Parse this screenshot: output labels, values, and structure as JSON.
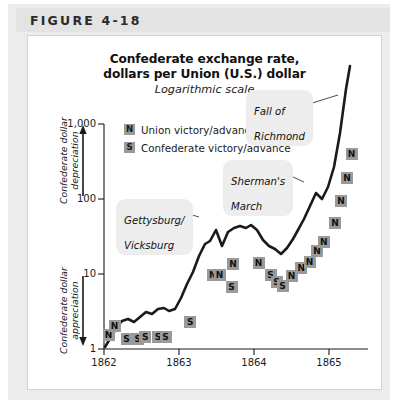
{
  "figure": {
    "header_label": "FIGURE 4-18",
    "title_line1": "Confederate exchange rate,",
    "title_line2": "dollars per Union (U.S.) dollar",
    "subtitle": "Logarithmic scale"
  },
  "legend": {
    "items": [
      {
        "marker": "N",
        "label": "Union victory/advance"
      },
      {
        "marker": "S",
        "label": "Confederate victory/advance"
      }
    ]
  },
  "side_labels": {
    "upper": "Confederate dollar\ndepreciation",
    "upper_line1": "Confederate dollar",
    "upper_line2": "depreciation",
    "lower_line1": "Confederate dollar",
    "lower_line2": "appreciation",
    "upper_arrow": "up-arrow",
    "lower_arrow": "down-arrow"
  },
  "annotations": [
    {
      "id": "gettysburg-vicksburg",
      "line1": "Gettysburg/",
      "line2": "Vicksburg"
    },
    {
      "id": "shermans-march",
      "line1": "Sherman's",
      "line2": "March"
    },
    {
      "id": "fall-of-richmond",
      "line1": "Fall of",
      "line2": "Richmond"
    }
  ],
  "chart_data": {
    "type": "line",
    "title": "Confederate exchange rate, dollars per Union (U.S.) dollar",
    "subtitle": "Logarithmic scale",
    "xlabel": "",
    "ylabel": "Confederate dollars per Union (U.S.) dollar",
    "yscale": "log",
    "ylim": [
      1,
      1000
    ],
    "ytick_labels": [
      "1",
      "10",
      "100",
      "1,000"
    ],
    "ytick_values": [
      1,
      10,
      100,
      1000
    ],
    "xlim": [
      1862.0,
      1865.5
    ],
    "xtick_labels": [
      "1862",
      "1863",
      "1864",
      "1865"
    ],
    "xtick_values": [
      1862,
      1863,
      1864,
      1865
    ],
    "grid": false,
    "legend_position": "top-left-inside",
    "series": [
      {
        "name": "Confederate exchange rate",
        "x": [
          1862.0,
          1862.08,
          1862.17,
          1862.25,
          1862.33,
          1862.42,
          1862.5,
          1862.58,
          1862.67,
          1862.75,
          1862.83,
          1862.92,
          1863.0,
          1863.08,
          1863.17,
          1863.25,
          1863.33,
          1863.42,
          1863.5,
          1863.58,
          1863.67,
          1863.75,
          1863.83,
          1863.92,
          1864.0,
          1864.08,
          1864.17,
          1864.25,
          1864.33,
          1864.42,
          1864.5,
          1864.58,
          1864.67,
          1864.75,
          1864.83,
          1864.92,
          1865.0,
          1865.08,
          1865.17,
          1865.25,
          1865.33,
          1865.42
        ],
        "y": [
          1.05,
          1.25,
          1.55,
          1.75,
          1.8,
          1.72,
          1.85,
          2.0,
          1.95,
          2.1,
          2.15,
          2.05,
          2.1,
          2.6,
          3.3,
          4.3,
          6.0,
          8.6,
          9.6,
          11.5,
          8.0,
          11.0,
          12.0,
          12.5,
          12.0,
          12.8,
          11.8,
          9.8,
          8.6,
          8.2,
          7.5,
          8.5,
          10.0,
          11.5,
          14.0,
          18.0,
          25.0,
          22.0,
          28.0,
          45.0,
          120.0,
          800.0
        ]
      }
    ],
    "event_markers": [
      {
        "label": "N",
        "x": 1862.06,
        "y": 1.55
      },
      {
        "label": "N",
        "x": 1862.14,
        "y": 2.05
      },
      {
        "label": "S",
        "x": 1862.3,
        "y": 1.35
      },
      {
        "label": "S",
        "x": 1862.45,
        "y": 1.35
      },
      {
        "label": "S",
        "x": 1862.55,
        "y": 1.45
      },
      {
        "label": "S",
        "x": 1862.72,
        "y": 1.45
      },
      {
        "label": "S",
        "x": 1862.82,
        "y": 1.45
      },
      {
        "label": "S",
        "x": 1863.15,
        "y": 2.3
      },
      {
        "label": "N",
        "x": 1863.45,
        "y": 9.6
      },
      {
        "label": "N",
        "x": 1863.54,
        "y": 9.6
      },
      {
        "label": "N",
        "x": 1863.72,
        "y": 13.5
      },
      {
        "label": "S",
        "x": 1863.7,
        "y": 6.8
      },
      {
        "label": "N",
        "x": 1864.06,
        "y": 14.0
      },
      {
        "label": "S",
        "x": 1864.22,
        "y": 9.8
      },
      {
        "label": "S",
        "x": 1864.3,
        "y": 7.8
      },
      {
        "label": "S",
        "x": 1864.38,
        "y": 7.0
      },
      {
        "label": "N",
        "x": 1864.5,
        "y": 9.5
      },
      {
        "label": "N",
        "x": 1864.63,
        "y": 12.0
      },
      {
        "label": "N",
        "x": 1864.74,
        "y": 14.5
      },
      {
        "label": "N",
        "x": 1864.84,
        "y": 20.0
      },
      {
        "label": "N",
        "x": 1864.93,
        "y": 27.0
      },
      {
        "label": "N",
        "x": 1865.08,
        "y": 48.0
      },
      {
        "label": "N",
        "x": 1865.16,
        "y": 95.0
      },
      {
        "label": "N",
        "x": 1865.24,
        "y": 190.0
      },
      {
        "label": "N",
        "x": 1865.3,
        "y": 400.0
      }
    ],
    "annotation_texts": [
      "Gettysburg/Vicksburg",
      "Sherman's March",
      "Fall of Richmond"
    ]
  }
}
